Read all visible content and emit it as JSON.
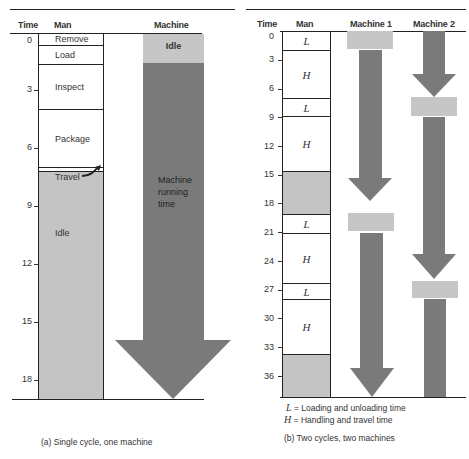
{
  "panel_a": {
    "headers": {
      "time": "Time",
      "man": "Man",
      "machine": "Machine"
    },
    "ticks": [
      "0",
      "3",
      "6",
      "9",
      "12",
      "15",
      "18"
    ],
    "man_segments": [
      {
        "label": "Remove",
        "start": 0,
        "end": 0.75
      },
      {
        "label": "Load",
        "start": 0.75,
        "end": 1.75
      },
      {
        "label": "Inspect",
        "start": 1.75,
        "end": 4.15
      },
      {
        "label": "Package",
        "start": 4.15,
        "end": 7.0
      },
      {
        "label": "",
        "start": 7.0,
        "end": 7.2
      },
      {
        "label": "Idle",
        "start": 7.2,
        "end": 19
      }
    ],
    "travel_label": "Travel",
    "machine_idle_label": "Idle",
    "machine_running_label_1": "Machine",
    "machine_running_label_2": "running",
    "machine_running_label_3": "time",
    "caption": "(a) Single cycle, one machine"
  },
  "panel_b": {
    "headers": {
      "time": "Time",
      "man": "Man",
      "machine1": "Machine 1",
      "machine2": "Machine 2"
    },
    "ticks": [
      "0",
      "3",
      "6",
      "9",
      "12",
      "15",
      "18",
      "21",
      "24",
      "27",
      "30",
      "33",
      "36"
    ],
    "man_segments": [
      {
        "label": "L",
        "start": 0,
        "end": 2
      },
      {
        "label": "H",
        "start": 2,
        "end": 7
      },
      {
        "label": "L",
        "start": 7,
        "end": 9
      },
      {
        "label": "H",
        "start": 9,
        "end": 15
      },
      {
        "label": "",
        "start": 15,
        "end": 19.5,
        "idle": true
      },
      {
        "label": "L",
        "start": 19.5,
        "end": 21.5
      },
      {
        "label": "H",
        "start": 21.5,
        "end": 26.5
      },
      {
        "label": "L",
        "start": 26.5,
        "end": 28.5
      },
      {
        "label": "H",
        "start": 28.5,
        "end": 34
      },
      {
        "label": "",
        "start": 34,
        "end": 38.2,
        "idle": true
      }
    ],
    "legend_l_sym": "L",
    "legend_l_text": "= Loading and unloading time",
    "legend_h_sym": "H",
    "legend_h_text": "= Handling and travel time",
    "caption": "(b) Two cycles, two machines"
  },
  "colors": {
    "running": "#7a7a7a",
    "idle": "#c4c4c4",
    "machine_idle": "#c6c6c6"
  }
}
